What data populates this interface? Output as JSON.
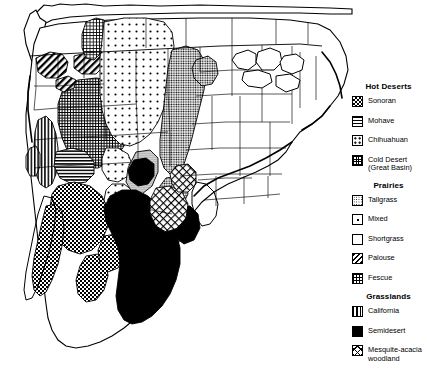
{
  "figure": {
    "type": "thematic-map",
    "region": "North America",
    "width": 429,
    "height": 375,
    "background_color": "#ffffff",
    "line_color": "#000000"
  },
  "legend": {
    "groups": [
      {
        "title": "Hot Deserts",
        "items": [
          {
            "label": "Sonoran",
            "pattern": "dense-checker",
            "swatch_class": "sw-sonoran"
          },
          {
            "label": "Mohave",
            "pattern": "horizontal-lines",
            "swatch_class": "sw-mohave"
          },
          {
            "label": "Chihuahuan",
            "pattern": "sparse-dots",
            "swatch_class": "sw-chihuahuan"
          },
          {
            "label": "Cold Desert\n(Great Basin)",
            "pattern": "dense-crosshatch",
            "swatch_class": "sw-colddesert"
          }
        ]
      },
      {
        "title": "Prairies",
        "items": [
          {
            "label": "Tallgrass",
            "pattern": "medium-stipple",
            "swatch_class": "sw-tallgrass"
          },
          {
            "label": "Mixed",
            "pattern": "very-sparse-dots",
            "swatch_class": "sw-mixed"
          },
          {
            "label": "Shortgrass",
            "pattern": "fine-dots",
            "swatch_class": "sw-shortgrass"
          },
          {
            "label": "Palouse",
            "pattern": "diagonal-stripes",
            "swatch_class": "sw-palouse"
          },
          {
            "label": "Fescue",
            "pattern": "dotted-crosshatch",
            "swatch_class": "sw-fescue"
          }
        ]
      },
      {
        "title": "Grasslands",
        "items": [
          {
            "label": "California",
            "pattern": "vertical-lines",
            "swatch_class": "sw-california"
          },
          {
            "label": "Semidesert",
            "pattern": "solid-black",
            "swatch_class": "sw-semidesert"
          },
          {
            "label": "Mesquite-acacia\nwoodland",
            "pattern": "coarse-crosshatch",
            "swatch_class": "sw-mesquite"
          }
        ]
      }
    ]
  }
}
